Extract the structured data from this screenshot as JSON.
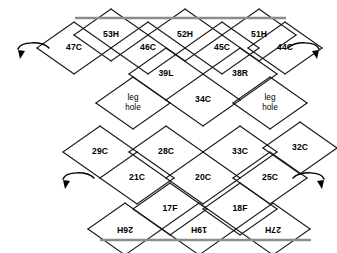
{
  "diagram": {
    "colors": {
      "cell_stroke": "#1a1a1a",
      "band_edge": "#8c8c8c",
      "label": "#000000",
      "background": "#ffffff"
    },
    "geometry": {
      "half_width": 37,
      "half_height": 26,
      "origin_x": 74,
      "origin_y": 22
    },
    "bands": {
      "top_edge": {
        "x1": 75,
        "x2": 286,
        "y": 18
      },
      "bottom_edge": {
        "x1": 100,
        "x2": 311,
        "y": 240
      }
    },
    "cells": [
      {
        "id": "c47",
        "label": "47C",
        "cx": 74,
        "cy": 48,
        "rotated": false
      },
      {
        "id": "c53",
        "label": "53H",
        "cx": 111,
        "cy": 35,
        "rotated": false
      },
      {
        "id": "c46",
        "label": "46C",
        "cx": 148,
        "cy": 48,
        "rotated": false
      },
      {
        "id": "c52",
        "label": "52H",
        "cx": 185,
        "cy": 35,
        "rotated": false
      },
      {
        "id": "c45",
        "label": "45C",
        "cx": 222,
        "cy": 48,
        "rotated": false
      },
      {
        "id": "c51",
        "label": "51H",
        "cx": 259,
        "cy": 35,
        "rotated": false
      },
      {
        "id": "c44",
        "label": "44C",
        "cx": 285,
        "cy": 48,
        "rotated": false
      },
      {
        "id": "c39",
        "label": "39L",
        "cx": 166,
        "cy": 74,
        "rotated": false
      },
      {
        "id": "c38",
        "label": "38R",
        "cx": 240,
        "cy": 74,
        "rotated": false
      },
      {
        "id": "lhL",
        "label": "leg\nhole",
        "cx": 133,
        "cy": 103,
        "rotated": false
      },
      {
        "id": "c34",
        "label": "34C",
        "cx": 203,
        "cy": 100,
        "rotated": false
      },
      {
        "id": "lhR",
        "label": "leg\nhole",
        "cx": 270,
        "cy": 103,
        "rotated": false
      },
      {
        "id": "c29",
        "label": "29C",
        "cx": 100,
        "cy": 152,
        "rotated": false
      },
      {
        "id": "c28",
        "label": "28C",
        "cx": 166,
        "cy": 152,
        "rotated": false
      },
      {
        "id": "c33",
        "label": "33C",
        "cx": 240,
        "cy": 152,
        "rotated": false
      },
      {
        "id": "c32",
        "label": "32C",
        "cx": 300,
        "cy": 148,
        "rotated": false
      },
      {
        "id": "c21",
        "label": "21C",
        "cx": 137,
        "cy": 178,
        "rotated": false
      },
      {
        "id": "c20",
        "label": "20C",
        "cx": 203,
        "cy": 178,
        "rotated": false
      },
      {
        "id": "c25",
        "label": "25C",
        "cx": 270,
        "cy": 178,
        "rotated": false
      },
      {
        "id": "c17",
        "label": "17F",
        "cx": 170,
        "cy": 209,
        "rotated": false
      },
      {
        "id": "c18",
        "label": "18F",
        "cx": 240,
        "cy": 209,
        "rotated": false
      },
      {
        "id": "c26",
        "label": "26H",
        "cx": 125,
        "cy": 229,
        "rotated": true
      },
      {
        "id": "c19",
        "label": "19H",
        "cx": 199,
        "cy": 229,
        "rotated": true
      },
      {
        "id": "c27",
        "label": "27H",
        "cx": 273,
        "cy": 229,
        "rotated": true
      }
    ],
    "arrows": [
      {
        "id": "arrow-top-left",
        "name": "fold-arrow-top-left",
        "cx": 30,
        "cy": 52,
        "flip": false
      },
      {
        "id": "arrow-top-right",
        "name": "fold-arrow-top-right",
        "cx": 307,
        "cy": 52,
        "flip": true
      },
      {
        "id": "arrow-bottom-left",
        "name": "fold-arrow-bottom-left",
        "cx": 75,
        "cy": 182,
        "flip": false
      },
      {
        "id": "arrow-bottom-right",
        "name": "fold-arrow-bottom-right",
        "cx": 312,
        "cy": 182,
        "flip": true
      }
    ]
  }
}
